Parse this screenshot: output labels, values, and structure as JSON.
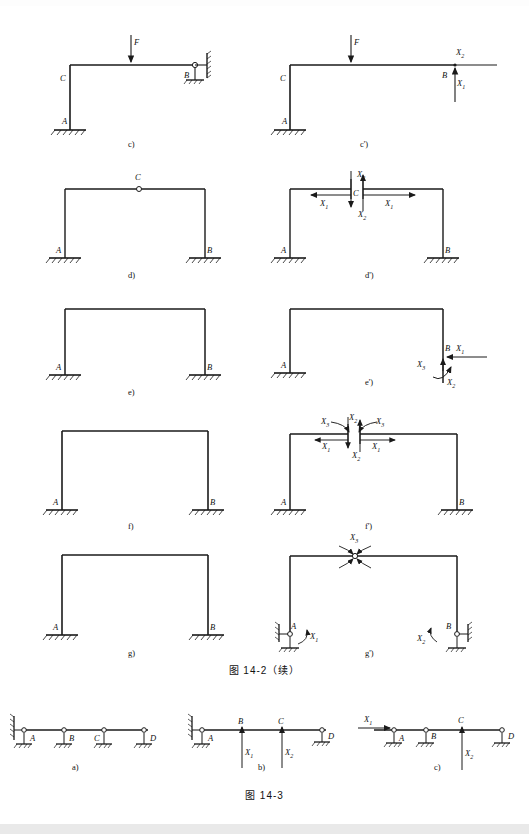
{
  "document": {
    "type": "textbook-figure-page",
    "width": 529,
    "height": 834,
    "ink_color": "#1a1a1a",
    "paper_color": "#ffffff"
  },
  "figures": [
    {
      "id": "fig-14-2",
      "caption": "图  14-2（续）",
      "panels": [
        {
          "key": "c",
          "label": "c)",
          "nodes": [
            "C",
            "A",
            "B"
          ],
          "loads": [
            "F"
          ],
          "description": "L-frame, fixed base at A, roller-pin support at B, point load F on beam"
        },
        {
          "key": "c-prime",
          "label": "c')",
          "nodes": [
            "C",
            "A",
            "B"
          ],
          "loads": [
            "F"
          ],
          "unknowns": [
            "X1",
            "X2"
          ],
          "description": "Released primary system of c) with redundants X1 (vertical) and X2 (horizontal) at B"
        },
        {
          "key": "d",
          "label": "d)",
          "nodes": [
            "A",
            "B",
            "C"
          ],
          "description": "Portal frame with internal hinge at crown C, fixed bases A and B"
        },
        {
          "key": "d-prime",
          "label": "d')",
          "nodes": [
            "A",
            "B",
            "C"
          ],
          "unknowns": [
            "X1",
            "X2"
          ],
          "description": "Cut at crown hinge C exposing redundant pair X1 (horizontal) and X2 (vertical)"
        },
        {
          "key": "e",
          "label": "e)",
          "nodes": [
            "A",
            "B"
          ],
          "description": "Portal frame with fixed bases at A and B"
        },
        {
          "key": "e-prime",
          "label": "e')",
          "nodes": [
            "A",
            "B"
          ],
          "unknowns": [
            "X1",
            "X2",
            "X3"
          ],
          "description": "Base B released: redundants X1 horizontal, X2 moment, X3 vertical"
        },
        {
          "key": "f",
          "label": "f)",
          "nodes": [
            "A",
            "B"
          ],
          "description": "Portal frame, fixed bases at A and B"
        },
        {
          "key": "f-prime",
          "label": "f')",
          "nodes": [
            "A",
            "B"
          ],
          "unknowns": [
            "X1",
            "X2",
            "X3"
          ],
          "description": "Beam cut at mid-span exposing three redundants X1, X2, X3 on each cut face"
        },
        {
          "key": "g",
          "label": "g)",
          "nodes": [
            "A",
            "B"
          ],
          "description": "Portal frame, fixed bases at A and B"
        },
        {
          "key": "g-prime",
          "label": "g')",
          "nodes": [
            "A",
            "B"
          ],
          "unknowns": [
            "X1",
            "X2",
            "X3"
          ],
          "description": "Hinges inserted at A, B and mid-span; redundant moments X1, X2, X3"
        }
      ]
    },
    {
      "id": "fig-14-3",
      "caption": "图  14-3",
      "panels": [
        {
          "key": "a",
          "label": "a)",
          "nodes": [
            "A",
            "B",
            "C",
            "D"
          ],
          "description": "Continuous beam on wall with four supports A, B, C, D"
        },
        {
          "key": "b",
          "label": "b)",
          "nodes": [
            "A",
            "B",
            "C",
            "D"
          ],
          "unknowns": [
            "X1",
            "X2"
          ],
          "description": "Supports at B and C removed, replaced by redundant forces X1 and X2"
        },
        {
          "key": "c",
          "label": "c)",
          "nodes": [
            "A",
            "B",
            "C",
            "D"
          ],
          "unknowns": [
            "X1",
            "X2"
          ],
          "description": "Wall restraint released at left end (X1) and support at C replaced by X2"
        }
      ]
    }
  ],
  "labels": {
    "A": "A",
    "B": "B",
    "C": "C",
    "D": "D",
    "F": "F",
    "X1": "X",
    "X2": "X",
    "X3": "X",
    "sub1": "1",
    "sub2": "2",
    "sub3": "3",
    "panel_c": "c)",
    "panel_cp": "c')",
    "panel_d": "d)",
    "panel_dp": "d')",
    "panel_e": "e)",
    "panel_ep": "e')",
    "panel_f": "f)",
    "panel_fp": "f')",
    "panel_g": "g)",
    "panel_gp": "g')",
    "panel_a3": "a)",
    "panel_b3": "b)",
    "panel_c3": "c)"
  }
}
